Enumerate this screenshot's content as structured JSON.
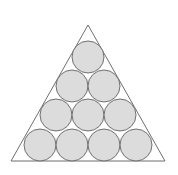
{
  "diagram": {
    "background": "#ffffff",
    "triangle": {
      "points": [
        [
          88,
          25
        ],
        [
          11,
          161
        ],
        [
          165,
          161
        ]
      ],
      "stroke": "#6f6f6f"
    },
    "circle_style": {
      "fill": "#dcdcdc",
      "stroke": "#707070",
      "r": 16
    },
    "rows": [
      {
        "row": 1,
        "count": 1,
        "cy": 57,
        "cx": [
          88
        ]
      },
      {
        "row": 2,
        "count": 2,
        "cy": 86,
        "cx": [
          72,
          104
        ]
      },
      {
        "row": 3,
        "count": 3,
        "cy": 115,
        "cx": [
          56,
          88,
          120
        ]
      },
      {
        "row": 4,
        "count": 4,
        "cy": 145,
        "cx": [
          40,
          72,
          104,
          136
        ]
      }
    ],
    "total_circles": 10
  }
}
